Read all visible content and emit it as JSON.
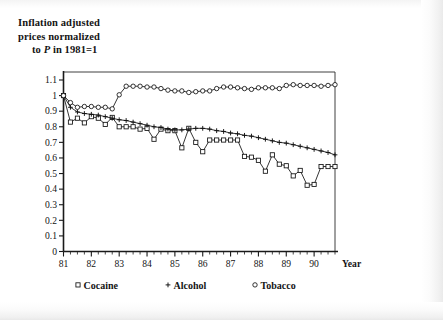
{
  "chart_data": {
    "type": "line",
    "title": "Inflation adjusted prices normalized to P in 1981=1",
    "title_lines": [
      "Inflation adjusted",
      "prices normalized",
      "to P in 1981=1"
    ],
    "title_line3_prefix": "to ",
    "title_line3_italic": "P",
    "title_line3_suffix": " in 1981=1",
    "xlabel": "Year",
    "ylabel": "",
    "xlim": [
      1981.0,
      1990.75
    ],
    "ylim": [
      0,
      1.15
    ],
    "xtick_labels": [
      "81",
      "82",
      "83",
      "84",
      "85",
      "86",
      "87",
      "88",
      "89",
      "90"
    ],
    "xtick_values": [
      1981,
      1982,
      1983,
      1984,
      1985,
      1986,
      1987,
      1988,
      1989,
      1990
    ],
    "xminor_per_major": 4,
    "ytick_labels": [
      "0",
      "0.1",
      "0.2",
      "0.3",
      "0.4",
      "0.5",
      "0.6",
      "0.7",
      "0.8",
      "0.9",
      "1",
      "1.1"
    ],
    "ytick_values": [
      0,
      0.1,
      0.2,
      0.3,
      0.4,
      0.5,
      0.6,
      0.7,
      0.8,
      0.9,
      1.0,
      1.1
    ],
    "grid": false,
    "legend_position": "below-axes",
    "x": [
      1981.0,
      1981.25,
      1981.5,
      1981.75,
      1982.0,
      1982.25,
      1982.5,
      1982.75,
      1983.0,
      1983.25,
      1983.5,
      1983.75,
      1984.0,
      1984.25,
      1984.5,
      1984.75,
      1985.0,
      1985.25,
      1985.5,
      1985.75,
      1986.0,
      1986.25,
      1986.5,
      1986.75,
      1987.0,
      1987.25,
      1987.5,
      1987.75,
      1988.0,
      1988.25,
      1988.5,
      1988.75,
      1989.0,
      1989.25,
      1989.5,
      1989.75,
      1990.0,
      1990.25,
      1990.5,
      1990.75
    ],
    "series": [
      {
        "name": "Cocaine",
        "marker": "square",
        "values": [
          1.0,
          0.83,
          0.855,
          0.825,
          0.865,
          0.855,
          0.815,
          0.86,
          0.8,
          0.8,
          0.8,
          0.785,
          0.79,
          0.72,
          0.785,
          0.775,
          0.775,
          0.665,
          0.79,
          0.7,
          0.64,
          0.715,
          0.715,
          0.715,
          0.715,
          0.715,
          0.61,
          0.605,
          0.585,
          0.515,
          0.62,
          0.56,
          0.55,
          0.485,
          0.52,
          0.425,
          0.43,
          0.545,
          0.545,
          0.545
        ]
      },
      {
        "name": "Alcohol",
        "marker": "plus",
        "values": [
          1.0,
          0.925,
          0.895,
          0.885,
          0.88,
          0.875,
          0.865,
          0.855,
          0.845,
          0.84,
          0.83,
          0.82,
          0.81,
          0.8,
          0.795,
          0.785,
          0.78,
          0.78,
          0.785,
          0.79,
          0.79,
          0.785,
          0.775,
          0.77,
          0.76,
          0.755,
          0.745,
          0.74,
          0.73,
          0.72,
          0.71,
          0.7,
          0.695,
          0.685,
          0.675,
          0.665,
          0.655,
          0.645,
          0.635,
          0.62
        ]
      },
      {
        "name": "Tobacco",
        "marker": "circle",
        "values": [
          1.0,
          0.955,
          0.925,
          0.93,
          0.93,
          0.925,
          0.925,
          0.915,
          1.005,
          1.06,
          1.06,
          1.06,
          1.055,
          1.055,
          1.045,
          1.035,
          1.03,
          1.03,
          1.02,
          1.025,
          1.03,
          1.03,
          1.045,
          1.055,
          1.055,
          1.05,
          1.045,
          1.04,
          1.05,
          1.05,
          1.05,
          1.045,
          1.065,
          1.07,
          1.065,
          1.065,
          1.065,
          1.06,
          1.065,
          1.07
        ]
      }
    ],
    "legend": [
      {
        "label": "Cocaine",
        "marker": "square"
      },
      {
        "label": "Alcohol",
        "marker": "plus"
      },
      {
        "label": "Tobacco",
        "marker": "circle"
      }
    ],
    "colors": {
      "ink": "#111111",
      "background": "#ffffff"
    }
  }
}
